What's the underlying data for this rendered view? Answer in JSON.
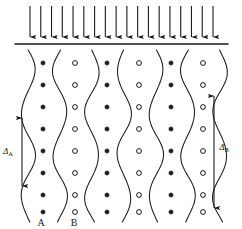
{
  "figure": {
    "title": "",
    "background_color": "#ffffff",
    "line_color": "#1a1a1a",
    "width": 242,
    "height": 229
  },
  "load_arrows": {
    "name": "applied-load-arrows",
    "count": 18,
    "direction": "down",
    "x_start": 30,
    "x_end": 213,
    "y_top": 6,
    "y_bottom": 37,
    "color": "#1a1a1a"
  },
  "surface_line": {
    "name": "specimen-surface-line",
    "y": 44,
    "x_start": 15,
    "x_end": 228,
    "color": "#1a1a1a"
  },
  "grain_columns": [
    {
      "id": "col-1",
      "marker": "filled",
      "center_x": 43,
      "label": "A"
    },
    {
      "id": "col-2",
      "marker": "open",
      "center_x": 75,
      "label": "B"
    },
    {
      "id": "col-3",
      "marker": "filled",
      "center_x": 107,
      "label": ""
    },
    {
      "id": "col-4",
      "marker": "open",
      "center_x": 139,
      "label": ""
    },
    {
      "id": "col-5",
      "marker": "filled",
      "center_x": 171,
      "label": ""
    },
    {
      "id": "col-6",
      "marker": "open",
      "center_x": 203,
      "label": ""
    }
  ],
  "marker_rows_y": [
    63,
    85,
    107,
    129,
    151,
    173,
    195,
    212
  ],
  "wavy_boundaries_x": [
    28,
    60,
    92,
    124,
    156,
    188,
    220
  ],
  "wave": {
    "amplitude_px": 7,
    "period_px": 84,
    "top_y": 50,
    "bottom_y": 222
  },
  "measure_arrows": [
    {
      "name": "delta-a-arrow",
      "label": "Δ",
      "subscript": "A",
      "x": 22,
      "y_top": 118,
      "y_bottom": 186,
      "label_x": 8,
      "label_y": 154
    },
    {
      "name": "delta-b-arrow",
      "label": "Δ",
      "subscript": "B",
      "x": 214,
      "y_top": 96,
      "y_bottom": 208,
      "label_x": 224,
      "label_y": 150
    }
  ],
  "bottom_labels": [
    {
      "name": "label-a",
      "text": "A",
      "x": 41,
      "y": 226
    },
    {
      "name": "label-b",
      "text": "B",
      "x": 74,
      "y": 226
    }
  ]
}
